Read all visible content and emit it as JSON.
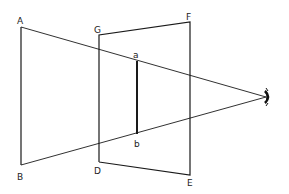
{
  "diagram": {
    "type": "perspective-projection",
    "labels": {
      "A": "A",
      "B": "B",
      "G": "G",
      "F": "F",
      "D": "D",
      "E": "E",
      "a": "a",
      "b": "b"
    },
    "icons": {
      "eye": "eye-icon"
    },
    "colors": {
      "line": "#1a1a1a",
      "background": "#ffffff"
    }
  }
}
